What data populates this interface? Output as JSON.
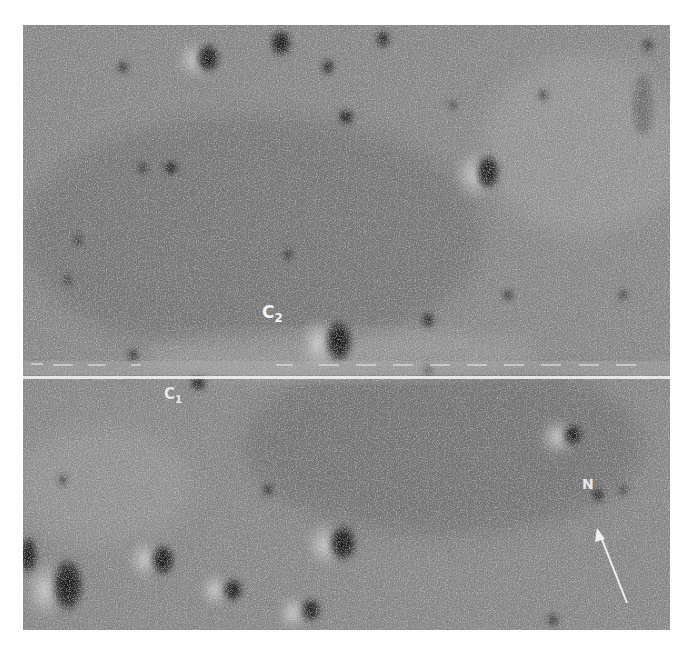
{
  "image": {
    "description": "Grainy grayscale orbital photograph of a cratered lunar surface, split by a horizontal white framelet seam with dashed tick marks above it",
    "background_color": "#ffffff",
    "surface_tone": "#8a8a8a"
  },
  "labels": {
    "c2": {
      "letter": "C",
      "subscript": "2"
    },
    "c1": {
      "letter": "C",
      "subscript": "1"
    },
    "north": {
      "text": "N"
    }
  },
  "seam": {
    "color": "#e8e8e8"
  },
  "craters": [
    {
      "x": 185,
      "y": 33,
      "rx": 12,
      "ry": 15
    },
    {
      "x": 258,
      "y": 18,
      "rx": 11,
      "ry": 14
    },
    {
      "x": 360,
      "y": 14,
      "rx": 7,
      "ry": 9
    },
    {
      "x": 305,
      "y": 42,
      "rx": 6,
      "ry": 8
    },
    {
      "x": 100,
      "y": 42,
      "rx": 5,
      "ry": 6
    },
    {
      "x": 465,
      "y": 147,
      "rx": 12,
      "ry": 18
    },
    {
      "x": 323,
      "y": 92,
      "rx": 8,
      "ry": 8
    },
    {
      "x": 148,
      "y": 143,
      "rx": 7,
      "ry": 7
    },
    {
      "x": 120,
      "y": 143,
      "rx": 5,
      "ry": 5
    },
    {
      "x": 45,
      "y": 255,
      "rx": 4,
      "ry": 5
    },
    {
      "x": 316,
      "y": 316,
      "rx": 14,
      "ry": 22
    },
    {
      "x": 175,
      "y": 358,
      "rx": 8,
      "ry": 8
    },
    {
      "x": 550,
      "y": 410,
      "rx": 10,
      "ry": 11
    },
    {
      "x": 320,
      "y": 518,
      "rx": 14,
      "ry": 19
    },
    {
      "x": 140,
      "y": 535,
      "rx": 12,
      "ry": 16
    },
    {
      "x": 45,
      "y": 560,
      "rx": 16,
      "ry": 28
    },
    {
      "x": 5,
      "y": 530,
      "rx": 10,
      "ry": 20
    },
    {
      "x": 210,
      "y": 565,
      "rx": 10,
      "ry": 12
    },
    {
      "x": 288,
      "y": 585,
      "rx": 10,
      "ry": 12
    },
    {
      "x": 485,
      "y": 270,
      "rx": 5,
      "ry": 5
    },
    {
      "x": 575,
      "y": 470,
      "rx": 6,
      "ry": 7
    },
    {
      "x": 405,
      "y": 345,
      "rx": 5,
      "ry": 5
    }
  ]
}
